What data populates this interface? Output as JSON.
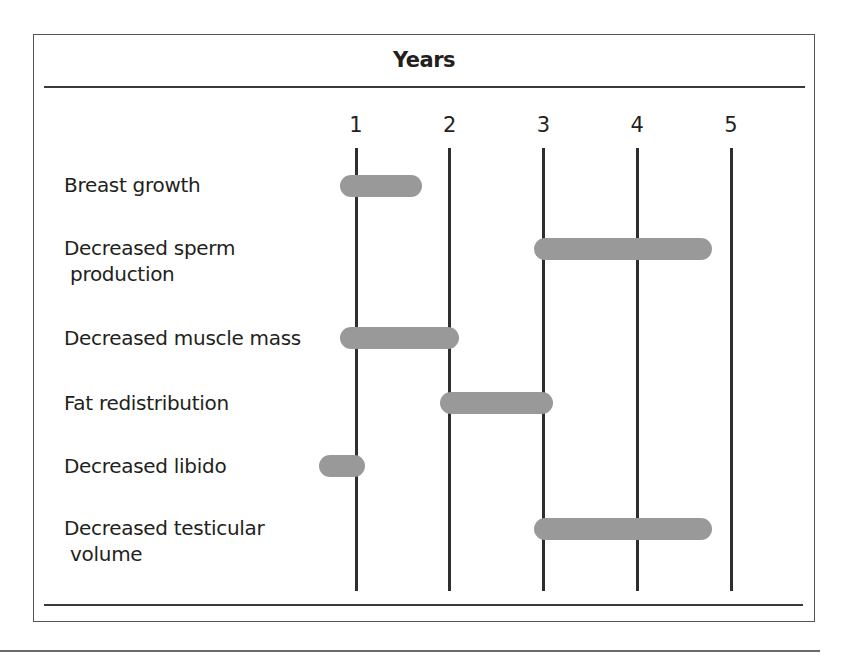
{
  "chart_data": {
    "type": "gantt",
    "title": "Years",
    "xlabel": "Years",
    "ylabel": "",
    "x_ticks": [
      1,
      2,
      3,
      4,
      5
    ],
    "xlim": [
      0.5,
      5
    ],
    "grid": "vertical lines at each year",
    "bar_color": "#999999",
    "rows": [
      {
        "label": "Breast growth",
        "label_lines": [
          "Breast growth"
        ],
        "start": 0.83,
        "end": 1.7
      },
      {
        "label": "Decreased sperm production",
        "label_lines": [
          "Decreased sperm",
          " production"
        ],
        "start": 2.9,
        "end": 4.8
      },
      {
        "label": "Decreased muscle mass",
        "label_lines": [
          "Decreased muscle mass"
        ],
        "start": 0.83,
        "end": 2.1
      },
      {
        "label": "Fat redistribution",
        "label_lines": [
          "Fat redistribution"
        ],
        "start": 1.9,
        "end": 3.1
      },
      {
        "label": "Decreased libido",
        "label_lines": [
          "Decreased libido"
        ],
        "start": 0.6,
        "end": 1.1
      },
      {
        "label": "Decreased testicular volume",
        "label_lines": [
          "Decreased testicular",
          " volume"
        ],
        "start": 2.9,
        "end": 4.8
      }
    ]
  },
  "header": {
    "title": "Years"
  },
  "axis": {
    "ticks": [
      "1",
      "2",
      "3",
      "4",
      "5"
    ]
  },
  "rows": [
    {
      "line1": "Breast growth",
      "line2": ""
    },
    {
      "line1": "Decreased sperm",
      "line2": " production"
    },
    {
      "line1": "Decreased muscle mass",
      "line2": ""
    },
    {
      "line1": "Fat redistribution",
      "line2": ""
    },
    {
      "line1": "Decreased libido",
      "line2": ""
    },
    {
      "line1": "Decreased testicular",
      "line2": " volume"
    }
  ]
}
